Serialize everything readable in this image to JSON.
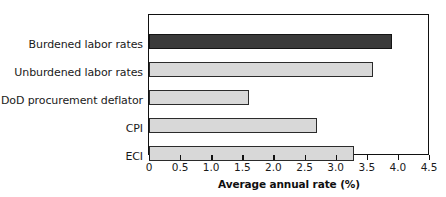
{
  "chart_data": {
    "type": "bar",
    "orientation": "horizontal",
    "title": "",
    "xlabel": "Average annual rate (%)",
    "ylabel": "",
    "xlim": [
      0,
      4.5
    ],
    "xticks": [
      "0",
      "0.5",
      "1.0",
      "1.5",
      "2.0",
      "2.5",
      "3.0",
      "3.5",
      "4.0",
      "4.5"
    ],
    "xtick_values": [
      0,
      0.5,
      1.0,
      1.5,
      2.0,
      2.5,
      3.0,
      3.5,
      4.0,
      4.5
    ],
    "grid": false,
    "legend": false,
    "categories": [
      "Burdened labor rates",
      "Unburdened labor rates",
      "DoD procurement deflator",
      "CPI",
      "ECI"
    ],
    "values": [
      3.9,
      3.6,
      1.6,
      2.7,
      3.3
    ],
    "bar_colors": [
      "#3a3a3a",
      "#d8d8d8",
      "#d8d8d8",
      "#d8d8d8",
      "#d8d8d8"
    ],
    "bar_styles": [
      "dark",
      "light",
      "light",
      "light",
      "light"
    ],
    "axis_color": "#111111",
    "background": "#ffffff"
  }
}
